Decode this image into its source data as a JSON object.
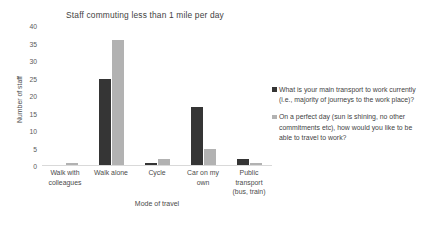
{
  "chart_data": {
    "type": "bar",
    "title": "Staff commuting less than 1 mile per day",
    "xlabel": "Mode of travel",
    "ylabel": "Number of staff",
    "ylim": [
      0,
      40
    ],
    "yticks": [
      40,
      35,
      30,
      25,
      20,
      15,
      10,
      5,
      0
    ],
    "grid": false,
    "legend_position": "right",
    "categories": [
      "Walk with colleagues",
      "Walk alone",
      "Cycle",
      "Car on my own",
      "Public transport (bus, train)"
    ],
    "category_lines": [
      [
        "Walk with",
        "colleagues"
      ],
      [
        "Walk alone"
      ],
      [
        "Cycle"
      ],
      [
        "Car on my",
        "own"
      ],
      [
        "Public",
        "transport",
        "(bus, train)"
      ]
    ],
    "series": [
      {
        "name": "What is your main transport to work currently (i.e., majority of journeys to the work place)?",
        "color": "#353535",
        "values": [
          0,
          25,
          1,
          17,
          2
        ]
      },
      {
        "name": "On a perfect day (sun is shining, no other commitments etc), how would you like to be able to travel to work?",
        "color": "#b2b2b2",
        "values": [
          1,
          36,
          2,
          5,
          1
        ]
      }
    ]
  },
  "axis_colors": {
    "axis_line": "#d9d9d9",
    "tick_text": "#5a5a5a",
    "label_text": "#4a4a4a",
    "title_text": "#3f3f3f"
  }
}
